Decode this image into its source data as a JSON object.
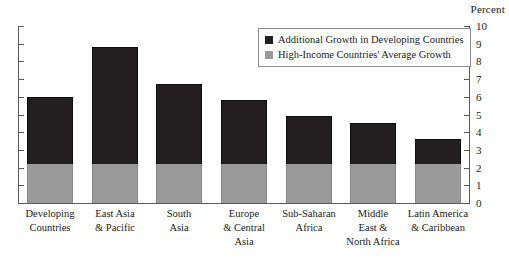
{
  "axis": {
    "unit_caption": "Percent",
    "y_ticks": [
      "0",
      "1",
      "2",
      "3",
      "4",
      "5",
      "6",
      "7",
      "8",
      "9",
      "10"
    ]
  },
  "legend": {
    "items": [
      {
        "label": "Additional Growth in Developing Countries",
        "color": "#231f20",
        "swatch": "dark-square-icon"
      },
      {
        "label": "High-Income Countries' Average Growth",
        "color": "#9a9a9a",
        "swatch": "gray-square-icon"
      }
    ]
  },
  "categories_display": [
    [
      "Developing",
      "Countries"
    ],
    [
      "East Asia",
      "& Pacific"
    ],
    [
      "South",
      "Asia"
    ],
    [
      "Europe",
      "& Central",
      "Asia"
    ],
    [
      "Sub-Saharan",
      "Africa"
    ],
    [
      "Middle",
      "East &",
      "North Africa"
    ],
    [
      "Latin America",
      "& Caribbean"
    ]
  ],
  "chart_data": {
    "type": "bar",
    "subtype": "stacked-bar",
    "title": "",
    "subtitle": "",
    "xlabel": "",
    "ylabel": "Percent",
    "ylim": [
      0,
      10
    ],
    "ytick_step": 1,
    "grid": false,
    "legend_position": "upper-right",
    "categories": [
      "Developing Countries",
      "East Asia & Pacific",
      "South Asia",
      "Europe & Central Asia",
      "Sub-Saharan Africa",
      "Middle East & North Africa",
      "Latin America & Caribbean"
    ],
    "series": [
      {
        "name": "High-Income Countries' Average Growth",
        "color": "#9a9a9a",
        "values": [
          2.2,
          2.2,
          2.2,
          2.2,
          2.2,
          2.2,
          2.2
        ]
      },
      {
        "name": "Additional Growth in Developing Countries",
        "color": "#231f20",
        "values": [
          3.8,
          6.6,
          4.5,
          3.6,
          2.7,
          2.3,
          1.4
        ]
      }
    ],
    "totals": [
      6.0,
      8.8,
      6.7,
      5.8,
      4.9,
      4.5,
      3.6
    ]
  }
}
